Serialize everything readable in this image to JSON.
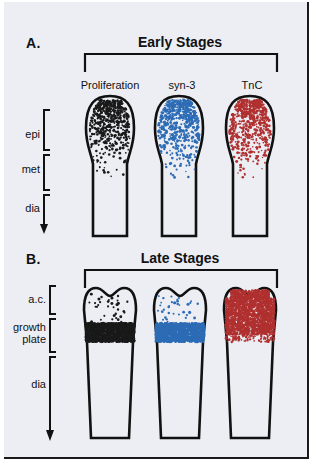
{
  "figure": {
    "background": "#eceef4",
    "ink": "#111111"
  },
  "panels": [
    {
      "letter": "A.",
      "title": "Early Stages",
      "columns": [
        {
          "label": "Proliferation",
          "color": "#1a1a1a",
          "pattern": "gradient-epiphysis"
        },
        {
          "label": "syn-3",
          "color": "#2d6cb5",
          "pattern": "gradient-epiphysis"
        },
        {
          "label": "TnC",
          "color": "#b03030",
          "pattern": "gradient-epiphysis"
        }
      ],
      "zones": [
        {
          "label": "epi",
          "type": "bracket"
        },
        {
          "label": "met",
          "type": "bracket"
        },
        {
          "label": "dia",
          "type": "arrow"
        }
      ]
    },
    {
      "letter": "B.",
      "title": "Late Stages",
      "columns": [
        {
          "label": "",
          "color": "#1a1a1a",
          "pattern": "band-growth-plate"
        },
        {
          "label": "",
          "color": "#2d6cb5",
          "pattern": "band-growth-plate"
        },
        {
          "label": "",
          "color": "#b03030",
          "pattern": "filled-articular-cartilage"
        }
      ],
      "zones": [
        {
          "label": "a.c.",
          "type": "bracket"
        },
        {
          "label": "growth\nplate",
          "type": "bracket"
        },
        {
          "label": "dia",
          "type": "arrow"
        }
      ]
    }
  ],
  "colors": {
    "black_stipple": "#1a1a1a",
    "blue_stipple": "#2d6cb5",
    "red_stipple": "#b03030"
  }
}
